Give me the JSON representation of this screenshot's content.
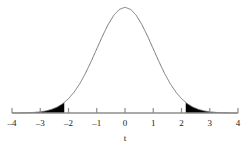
{
  "chart_data": {
    "type": "area",
    "title": "",
    "subtitle": "",
    "xlabel": "t",
    "ylabel": "",
    "grid": false,
    "legend": null,
    "xlim": [
      -4,
      4
    ],
    "ylim": [
      0,
      0.41
    ],
    "x_ticks": [
      -4,
      -3,
      -2,
      -1,
      0,
      1,
      2,
      3,
      4
    ],
    "x_tick_labels": [
      "–4",
      "–3",
      "–2",
      "–1",
      "0",
      "1",
      "2",
      "3",
      "4"
    ],
    "curve": {
      "name": "t distribution density",
      "distribution": "student-t",
      "peak_x": 0,
      "peak_y": 0.4,
      "line_color": "#6b6b6b",
      "line_width": 0.9,
      "x": [
        -4.0,
        -3.8,
        -3.6,
        -3.4,
        -3.2,
        -3.0,
        -2.8,
        -2.6,
        -2.4,
        -2.2,
        -2.0,
        -1.8,
        -1.6,
        -1.4,
        -1.2,
        -1.0,
        -0.8,
        -0.6,
        -0.4,
        -0.2,
        0.0,
        0.2,
        0.4,
        0.6,
        0.8,
        1.0,
        1.2,
        1.4,
        1.6,
        1.8,
        2.0,
        2.2,
        2.4,
        2.6,
        2.8,
        3.0,
        3.2,
        3.4,
        3.6,
        3.8,
        4.0
      ],
      "y": [
        0.0001,
        0.0003,
        0.0006,
        0.0012,
        0.0024,
        0.0044,
        0.0079,
        0.0136,
        0.0224,
        0.0355,
        0.054,
        0.079,
        0.1109,
        0.1497,
        0.1942,
        0.242,
        0.2897,
        0.3332,
        0.3683,
        0.391,
        0.3989,
        0.391,
        0.3683,
        0.3332,
        0.2897,
        0.242,
        0.1942,
        0.1497,
        0.1109,
        0.079,
        0.054,
        0.0355,
        0.0224,
        0.0136,
        0.0079,
        0.0044,
        0.0024,
        0.0012,
        0.0006,
        0.0003,
        0.0001
      ]
    },
    "shaded_regions": [
      {
        "name": "left-tail",
        "from": -4.0,
        "to": -2.15,
        "fill_color": "#000000"
      },
      {
        "name": "right-tail",
        "from": 2.15,
        "to": 4.0,
        "fill_color": "#000000"
      }
    ],
    "axis_color": "#8c8c8c",
    "text_color": "#1a1a1a"
  }
}
